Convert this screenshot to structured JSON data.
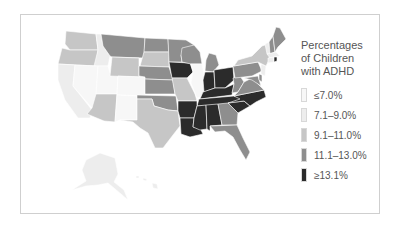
{
  "legend": {
    "title_lines": [
      "Percentages",
      "of Children",
      "with ADHD"
    ],
    "items": [
      {
        "label": "≤7.0%",
        "color": "#f7f7f7"
      },
      {
        "label": "7.1–9.0%",
        "color": "#ededed"
      },
      {
        "label": "9.1–11.0%",
        "color": "#c6c6c6"
      },
      {
        "label": "11.1–13.0%",
        "color": "#8e8e8e"
      },
      {
        "label": "≥13.1%",
        "color": "#2b2b2b"
      }
    ]
  },
  "map": {
    "region": "United States",
    "colors": {
      "c1": "#f7f7f7",
      "c2": "#ededed",
      "c3": "#c6c6c6",
      "c4": "#8e8e8e",
      "c5": "#2b2b2b"
    }
  }
}
